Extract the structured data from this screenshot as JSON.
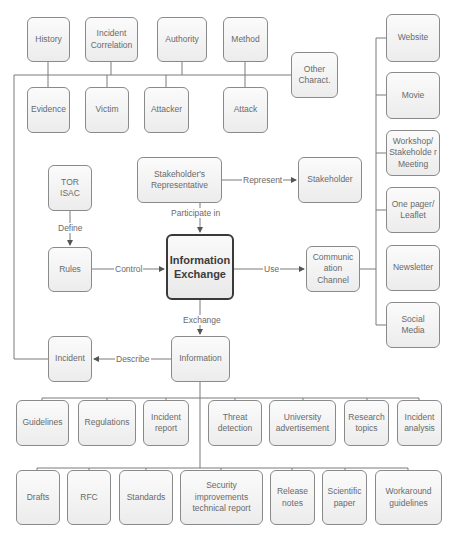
{
  "diagram": {
    "central": "Information Exchange",
    "nodes": {
      "history": "History",
      "incident_correlation": "Incident Correlation",
      "authority": "Authority",
      "method": "Method",
      "other_charact": "Other Charact.",
      "evidence": "Evidence",
      "victim": "Victim",
      "attacker": "Attacker",
      "attack": "Attack",
      "tor_isac": "TOR ISAC",
      "rules": "Rules",
      "stakeholders_representative": "Stakeholder's Representative",
      "stakeholder": "Stakeholder",
      "communication_channel": "Communic ation Channel",
      "incident": "Incident",
      "information": "Information"
    },
    "channels": [
      "Website",
      "Movie",
      "Workshop/ Stakeholde r Meeting",
      "One pager/ Leaflet",
      "Newsletter",
      "Social Media"
    ],
    "information_types_row1": [
      "Guidelines",
      "Regulations",
      "Incident report",
      "Threat detection",
      "University advertisement",
      "Research topics",
      "Incident analysis"
    ],
    "information_types_row2": [
      "Drafts",
      "RFC",
      "Standards",
      "Security improvements technical report",
      "Release notes",
      "Scientific paper",
      "Workaround guidelines"
    ],
    "edges": {
      "define": "Define",
      "control": "Control",
      "represent": "Represent",
      "participate_in": "Participate in",
      "use": "Use",
      "exchange": "Exchange",
      "describe": "Describe"
    }
  }
}
